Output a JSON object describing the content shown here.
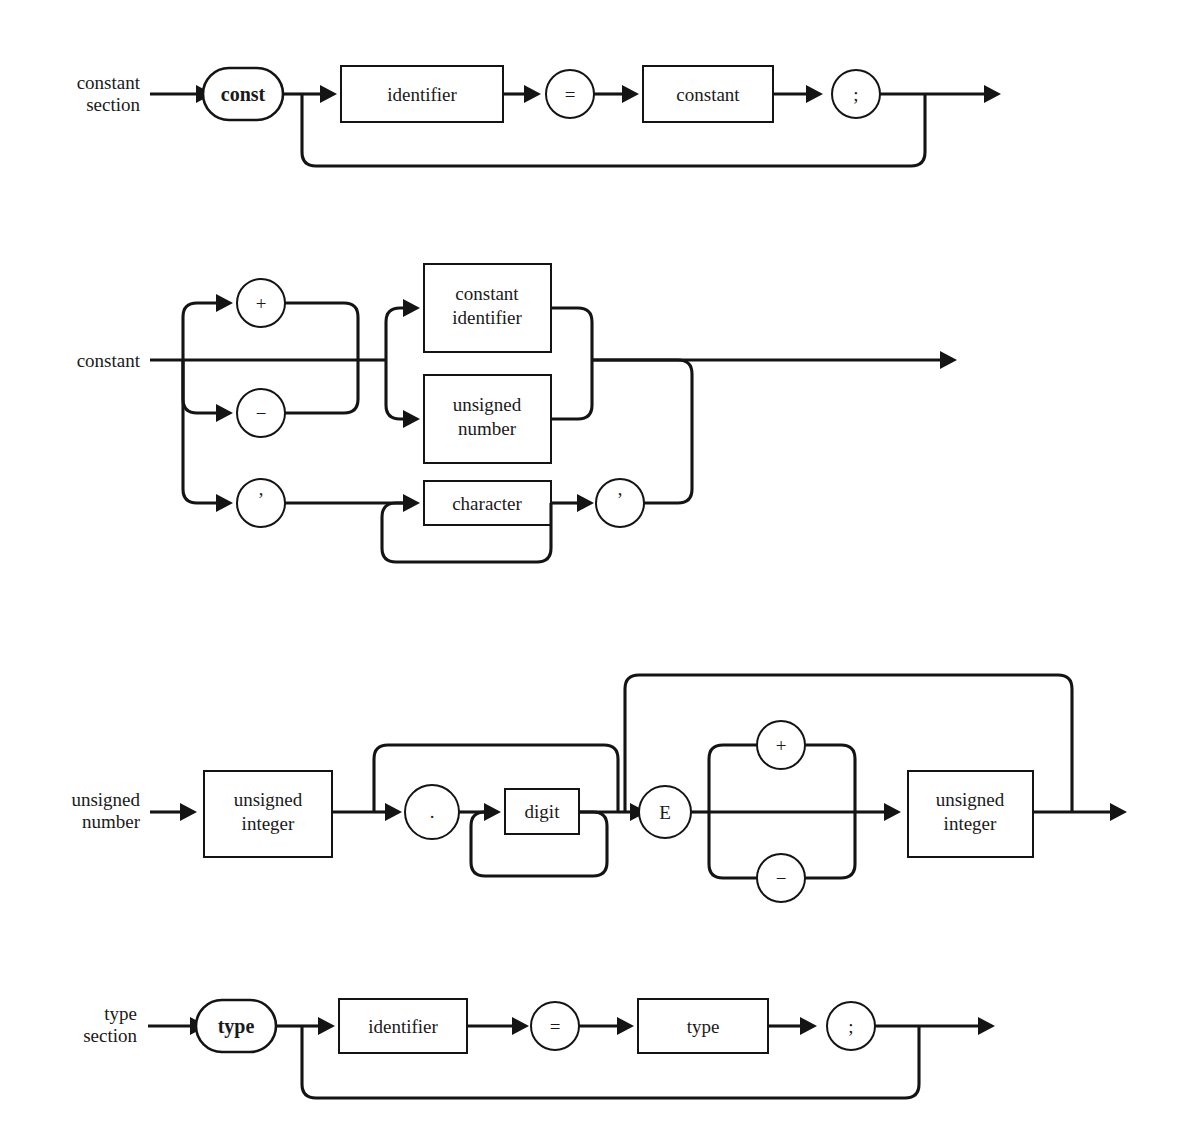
{
  "page": {
    "background_color": "#ffffff",
    "ink_color": "#141414",
    "width": 1193,
    "height": 1143
  },
  "diagrams": [
    {
      "id": "constant-section",
      "rule_label_lines": [
        "constant",
        "section"
      ],
      "nodes": [
        {
          "id": "kw-const",
          "kind": "stadium",
          "text": "const"
        },
        {
          "id": "identifier",
          "kind": "box",
          "text": "identifier"
        },
        {
          "id": "equals",
          "kind": "circle",
          "text": "="
        },
        {
          "id": "constant-ref",
          "kind": "box",
          "text": "constant"
        },
        {
          "id": "semicolon",
          "kind": "circle",
          "text": ";"
        }
      ],
      "loop": {
        "from": "semicolon",
        "to": "identifier",
        "description": "repeat constant definitions"
      }
    },
    {
      "id": "constant",
      "rule_label_lines": [
        "constant"
      ],
      "nodes": [
        {
          "id": "plus",
          "kind": "circle",
          "text": "+"
        },
        {
          "id": "minus",
          "kind": "circle",
          "text": "−"
        },
        {
          "id": "quote-open",
          "kind": "circle",
          "text": "’"
        },
        {
          "id": "constant-identifier",
          "kind": "box",
          "text": "constant identifier",
          "text_lines": [
            "constant",
            "identifier"
          ]
        },
        {
          "id": "unsigned-number",
          "kind": "box",
          "text": "unsigned number",
          "text_lines": [
            "unsigned",
            "number"
          ]
        },
        {
          "id": "character",
          "kind": "box",
          "text": "character"
        },
        {
          "id": "quote-close",
          "kind": "circle",
          "text": "’"
        }
      ],
      "branches": [
        {
          "group": "sign",
          "options": [
            "plus",
            "empty",
            "minus",
            "quote-open"
          ]
        },
        {
          "group": "value",
          "options": [
            "constant-identifier",
            "unsigned-number"
          ]
        }
      ],
      "loop": {
        "from": "character",
        "to": "character",
        "description": "repeat character"
      }
    },
    {
      "id": "unsigned-number",
      "rule_label_lines": [
        "unsigned",
        "number"
      ],
      "nodes": [
        {
          "id": "unsigned-integer-1",
          "kind": "box",
          "text": "unsigned integer",
          "text_lines": [
            "unsigned",
            "integer"
          ]
        },
        {
          "id": "period",
          "kind": "circle",
          "text": "."
        },
        {
          "id": "digit",
          "kind": "box",
          "text": "digit"
        },
        {
          "id": "exponent-e",
          "kind": "circle",
          "text": "E"
        },
        {
          "id": "exp-plus",
          "kind": "circle",
          "text": "+"
        },
        {
          "id": "exp-minus",
          "kind": "circle",
          "text": "−"
        },
        {
          "id": "unsigned-integer-2",
          "kind": "box",
          "text": "unsigned integer",
          "text_lines": [
            "unsigned",
            "integer"
          ]
        }
      ],
      "branches": [
        {
          "group": "exponent-sign",
          "options": [
            "exp-plus",
            "empty",
            "exp-minus"
          ]
        }
      ],
      "bypasses": [
        {
          "id": "skip-fraction",
          "over": [
            "period",
            "digit"
          ]
        },
        {
          "id": "skip-exponent",
          "over": [
            "exponent-e",
            "exp-plus",
            "exp-minus",
            "unsigned-integer-2"
          ]
        }
      ],
      "loop": {
        "from": "digit",
        "to": "digit",
        "description": "repeat digit"
      }
    },
    {
      "id": "type-section",
      "rule_label_lines": [
        "type",
        "section"
      ],
      "nodes": [
        {
          "id": "kw-type",
          "kind": "stadium",
          "text": "type"
        },
        {
          "id": "identifier",
          "kind": "box",
          "text": "identifier"
        },
        {
          "id": "equals",
          "kind": "circle",
          "text": "="
        },
        {
          "id": "type-ref",
          "kind": "box",
          "text": "type"
        },
        {
          "id": "semicolon",
          "kind": "circle",
          "text": ";"
        }
      ],
      "loop": {
        "from": "semicolon",
        "to": "identifier",
        "description": "repeat type definitions"
      }
    }
  ],
  "labels": {
    "d1_label_1": "constant",
    "d1_label_2": "section",
    "d1_const": "const",
    "d1_identifier": "identifier",
    "d1_equals": "=",
    "d1_constant": "constant",
    "d1_semicolon": ";",
    "d2_label_1": "constant",
    "d2_plus": "+",
    "d2_minus": "−",
    "d2_quote_open": "’",
    "d2_const_ident_1": "constant",
    "d2_const_ident_2": "identifier",
    "d2_unsigned_num_1": "unsigned",
    "d2_unsigned_num_2": "number",
    "d2_character": "character",
    "d2_quote_close": "’",
    "d3_label_1": "unsigned",
    "d3_label_2": "number",
    "d3_uint1_1": "unsigned",
    "d3_uint1_2": "integer",
    "d3_period": ".",
    "d3_digit": "digit",
    "d3_e": "E",
    "d3_plus": "+",
    "d3_minus": "−",
    "d3_uint2_1": "unsigned",
    "d3_uint2_2": "integer",
    "d4_label_1": "type",
    "d4_label_2": "section",
    "d4_type_kw": "type",
    "d4_identifier": "identifier",
    "d4_equals": "=",
    "d4_type": "type",
    "d4_semicolon": ";"
  }
}
